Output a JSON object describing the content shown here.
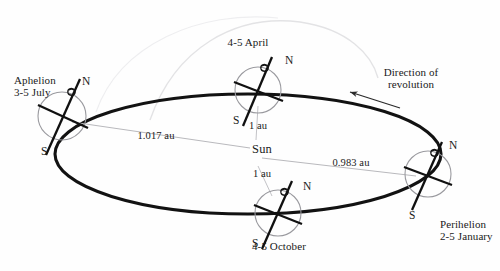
{
  "diagram": {
    "center_body": {
      "name": "sun-label",
      "label": "Sun"
    },
    "orbit": {
      "type": "ellipse",
      "stroke_color": "#111111",
      "ghost_arc_color": "#e2e2e4"
    },
    "revolution": {
      "label_line1": "Direction of",
      "label_line2": "revolution",
      "arrow_direction": "left"
    },
    "distances": [
      {
        "name": "aphelion-distance",
        "value": "1.017 au"
      },
      {
        "name": "perihelion-distance",
        "value": "0.983 au"
      },
      {
        "name": "april-distance",
        "value": "1 au"
      },
      {
        "name": "october-distance",
        "value": "1 au"
      }
    ],
    "positions": [
      {
        "id": "aphelion",
        "name": "Aphelion",
        "date": "3-5 July",
        "label_line1": "Aphelion",
        "label_line2": "3-5 July",
        "north_label": "N",
        "south_label": "S",
        "distance": "1.017 au"
      },
      {
        "id": "april",
        "name": "April position",
        "date": "4-5 April",
        "label_line1": "4-5 April",
        "label_line2": "",
        "north_label": "N",
        "south_label": "S",
        "distance": "1 au"
      },
      {
        "id": "perihelion",
        "name": "Perihelion",
        "date": "2-5 January",
        "label_line1": "Perihelion",
        "label_line2": "2-5 January",
        "north_label": "N",
        "south_label": "S",
        "distance": "0.983 au"
      },
      {
        "id": "october",
        "name": "October position",
        "date": "4-5 October",
        "label_line1": "4-5 October",
        "label_line2": "",
        "north_label": "N",
        "south_label": "S",
        "distance": "1 au"
      }
    ]
  }
}
